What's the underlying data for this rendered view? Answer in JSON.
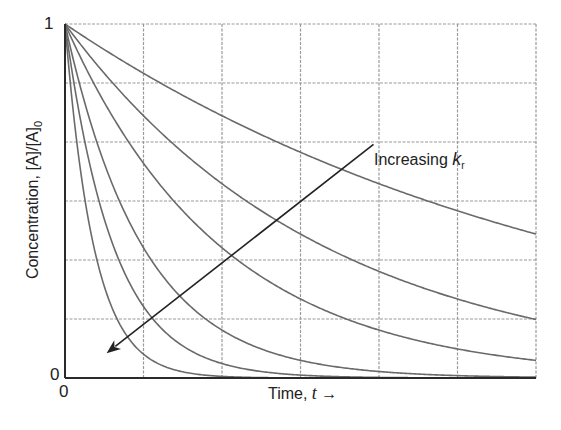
{
  "chart_data": {
    "type": "line",
    "title": "",
    "xlabel": "Time, t",
    "xlabel_text": "Time, ",
    "xlabel_var": "t",
    "xlabel_arrow": "→",
    "ylabel": "Concentration, [A]/[A]0",
    "ylabel_text": "Concentration, [A]/[A]",
    "ylabel_sub": "0",
    "xlim": [
      0,
      6
    ],
    "ylim": [
      0,
      1
    ],
    "x_ticks": [
      {
        "value": 0,
        "label": "0"
      }
    ],
    "y_ticks": [
      {
        "value": 0,
        "label": "0"
      },
      {
        "value": 1,
        "label": "1"
      }
    ],
    "grid": {
      "on": true,
      "x_divisions": 6,
      "y_divisions": 6,
      "style": "dashed"
    },
    "legend": null,
    "function": "exp(-k*t)",
    "series": [
      {
        "name": "k1",
        "k": 0.15
      },
      {
        "name": "k2",
        "k": 0.3
      },
      {
        "name": "k3",
        "k": 0.5
      },
      {
        "name": "k4",
        "k": 1.0
      },
      {
        "name": "k5",
        "k": 1.6
      },
      {
        "name": "k6",
        "k": 2.7
      }
    ],
    "annotation": {
      "text": "Increasing ",
      "var": "k",
      "sub": "r",
      "arrow_from": [
        3.93,
        0.66
      ],
      "arrow_to": [
        0.53,
        0.07
      ]
    },
    "colors": {
      "curve": "#6a6a6a",
      "grid": "#9a9a9a",
      "axis": "#2a2a2a",
      "arrow": "#222222"
    }
  }
}
